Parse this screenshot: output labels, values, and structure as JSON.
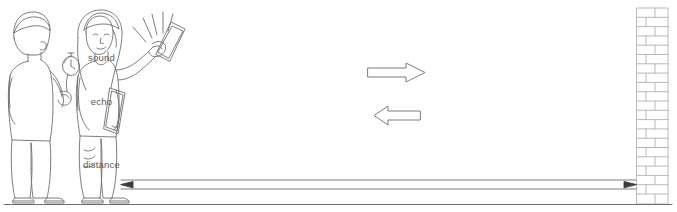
{
  "diagram": {
    "background_color": "#ffffff",
    "line_color": "#6e6e70",
    "text_color": "#58585a",
    "labels": {
      "sound": "sound",
      "echo": "echo",
      "distance": "distance"
    },
    "figures": [
      {
        "name": "person-with-stopwatch",
        "holds": "stopwatch"
      },
      {
        "name": "person-with-boards",
        "holds": "clapper boards"
      }
    ],
    "wall": {
      "name": "brick-wall",
      "pattern": "running bond",
      "rows": 21
    },
    "arrows": [
      {
        "name": "sound-arrow",
        "direction": "right",
        "style": "block-outline"
      },
      {
        "name": "echo-arrow",
        "direction": "left",
        "style": "block-outline"
      },
      {
        "name": "distance-arrow",
        "direction": "both",
        "style": "line"
      }
    ],
    "ground": {
      "name": "ground-line"
    }
  }
}
